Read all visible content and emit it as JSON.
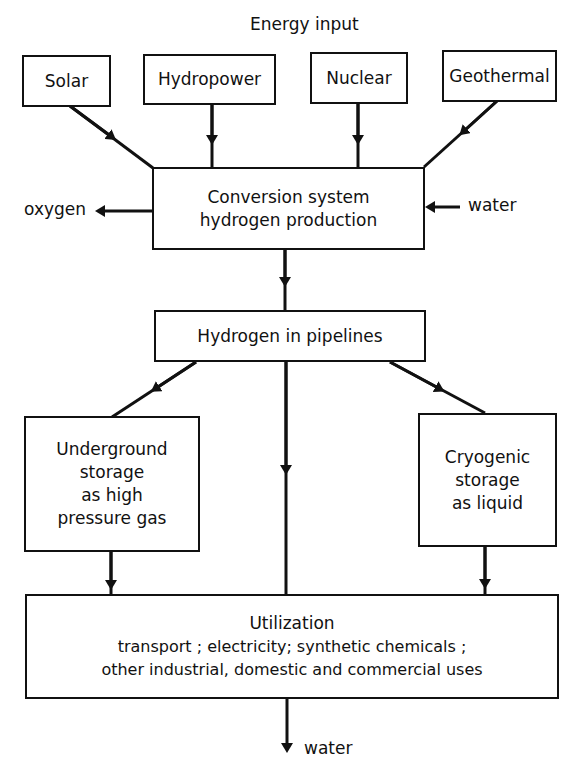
{
  "title": "Energy input",
  "sources": [
    {
      "id": "solar",
      "label": "Solar"
    },
    {
      "id": "hydropower",
      "label": "Hydropower"
    },
    {
      "id": "nuclear",
      "label": "Nuclear"
    },
    {
      "id": "geothermal",
      "label": "Geothermal"
    }
  ],
  "conversion": {
    "line1": "Conversion system",
    "line2": "hydrogen production"
  },
  "conversion_output": "oxygen",
  "conversion_input": "water",
  "pipelines": "Hydrogen in pipelines",
  "underground": {
    "line1": "Underground",
    "line2": "storage",
    "line3": "as high",
    "line4": "pressure gas"
  },
  "cryogenic": {
    "line1": "Cryogenic",
    "line2": "storage",
    "line3": "as liquid"
  },
  "utilization": {
    "title": "Utilization",
    "line1": "transport ; electricity; synthetic chemicals ;",
    "line2": "other industrial, domestic and commercial uses"
  },
  "final_output": "water"
}
